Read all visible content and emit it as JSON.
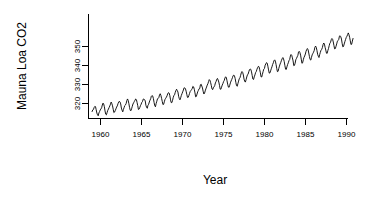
{
  "figure": {
    "background_color": "#ffffff",
    "foreground_color": "#000000",
    "width": 368,
    "height": 202
  },
  "axes": {
    "x_title": "Year",
    "y_title": "Mauna Loa CO2",
    "x_tick_labels": [
      "1960",
      "1965",
      "1970",
      "1975",
      "1980",
      "1985",
      "1990"
    ],
    "y_tick_labels": [
      "320",
      "330",
      "340",
      "350"
    ],
    "box_style": "L-shaped axes with outward ticks"
  },
  "chart_data": {
    "type": "line",
    "title": "",
    "subtitle": "",
    "xlabel": "Year",
    "ylabel": "Mauna Loa CO2",
    "xlim": [
      1958.5,
      1990.3
    ],
    "ylim": [
      312.0,
      367.0
    ],
    "xticks": [
      1960,
      1965,
      1970,
      1975,
      1980,
      1985,
      1990
    ],
    "yticks": [
      320,
      330,
      340,
      350
    ],
    "grid": false,
    "legend": null,
    "legend_position": "none",
    "annotations": [],
    "series": [
      {
        "name": "Atmospheric CO2 concentration (ppm)",
        "units": "ppm",
        "description": "Monthly mean atmospheric CO2 concentration at Mauna Loa Observatory, Jan 1959 - Dec 1990, showing long-term rising trend with annual seasonal cycle.",
        "x": [
          1959.0,
          1959.083,
          1959.167,
          1959.25,
          1959.333,
          1959.417,
          1959.5,
          1959.583,
          1959.667,
          1959.75,
          1959.833,
          1959.917,
          1960.0,
          1960.083,
          1960.167,
          1960.25,
          1960.333,
          1960.417,
          1960.5,
          1960.583,
          1960.667,
          1960.75,
          1960.833,
          1960.917,
          1961.0,
          1961.083,
          1961.167,
          1961.25,
          1961.333,
          1961.417,
          1961.5,
          1961.583,
          1961.667,
          1961.75,
          1961.833,
          1961.917,
          1962.0,
          1962.083,
          1962.167,
          1962.25,
          1962.333,
          1962.417,
          1962.5,
          1962.583,
          1962.667,
          1962.75,
          1962.833,
          1962.917,
          1963.0,
          1963.083,
          1963.167,
          1963.25,
          1963.333,
          1963.417,
          1963.5,
          1963.583,
          1963.667,
          1963.75,
          1963.833,
          1963.917,
          1964.0,
          1964.083,
          1964.167,
          1964.25,
          1964.333,
          1964.417,
          1964.5,
          1964.583,
          1964.667,
          1964.75,
          1964.833,
          1964.917,
          1965.0,
          1965.083,
          1965.167,
          1965.25,
          1965.333,
          1965.417,
          1965.5,
          1965.583,
          1965.667,
          1965.75,
          1965.833,
          1965.917,
          1966.0,
          1966.083,
          1966.167,
          1966.25,
          1966.333,
          1966.417,
          1966.5,
          1966.583,
          1966.667,
          1966.75,
          1966.833,
          1966.917,
          1967.0,
          1967.083,
          1967.167,
          1967.25,
          1967.333,
          1967.417,
          1967.5,
          1967.583,
          1967.667,
          1967.75,
          1967.833,
          1967.917,
          1968.0,
          1968.083,
          1968.167,
          1968.25,
          1968.333,
          1968.417,
          1968.5,
          1968.583,
          1968.667,
          1968.75,
          1968.833,
          1968.917,
          1969.0,
          1969.083,
          1969.167,
          1969.25,
          1969.333,
          1969.417,
          1969.5,
          1969.583,
          1969.667,
          1969.75,
          1969.833,
          1969.917,
          1970.0,
          1970.083,
          1970.167,
          1970.25,
          1970.333,
          1970.417,
          1970.5,
          1970.583,
          1970.667,
          1970.75,
          1970.833,
          1970.917,
          1971.0,
          1971.083,
          1971.167,
          1971.25,
          1971.333,
          1971.417,
          1971.5,
          1971.583,
          1971.667,
          1971.75,
          1971.833,
          1971.917,
          1972.0,
          1972.083,
          1972.167,
          1972.25,
          1972.333,
          1972.417,
          1972.5,
          1972.583,
          1972.667,
          1972.75,
          1972.833,
          1972.917,
          1973.0,
          1973.083,
          1973.167,
          1973.25,
          1973.333,
          1973.417,
          1973.5,
          1973.583,
          1973.667,
          1973.75,
          1973.833,
          1973.917,
          1974.0,
          1974.083,
          1974.167,
          1974.25,
          1974.333,
          1974.417,
          1974.5,
          1974.583,
          1974.667,
          1974.75,
          1974.833,
          1974.917,
          1975.0,
          1975.083,
          1975.167,
          1975.25,
          1975.333,
          1975.417,
          1975.5,
          1975.583,
          1975.667,
          1975.75,
          1975.833,
          1975.917,
          1976.0,
          1976.083,
          1976.167,
          1976.25,
          1976.333,
          1976.417,
          1976.5,
          1976.583,
          1976.667,
          1976.75,
          1976.833,
          1976.917,
          1977.0,
          1977.083,
          1977.167,
          1977.25,
          1977.333,
          1977.417,
          1977.5,
          1977.583,
          1977.667,
          1977.75,
          1977.833,
          1977.917,
          1978.0,
          1978.083,
          1978.167,
          1978.25,
          1978.333,
          1978.417,
          1978.5,
          1978.583,
          1978.667,
          1978.75,
          1978.833,
          1978.917,
          1979.0,
          1979.083,
          1979.167,
          1979.25,
          1979.333,
          1979.417,
          1979.5,
          1979.583,
          1979.667,
          1979.75,
          1979.833,
          1979.917,
          1980.0,
          1980.083,
          1980.167,
          1980.25,
          1980.333,
          1980.417,
          1980.5,
          1980.583,
          1980.667,
          1980.75,
          1980.833,
          1980.917,
          1981.0,
          1981.083,
          1981.167,
          1981.25,
          1981.333,
          1981.417,
          1981.5,
          1981.583,
          1981.667,
          1981.75,
          1981.833,
          1981.917,
          1982.0,
          1982.083,
          1982.167,
          1982.25,
          1982.333,
          1982.417,
          1982.5,
          1982.583,
          1982.667,
          1982.75,
          1982.833,
          1982.917,
          1983.0,
          1983.083,
          1983.167,
          1983.25,
          1983.333,
          1983.417,
          1983.5,
          1983.583,
          1983.667,
          1983.75,
          1983.833,
          1983.917,
          1984.0,
          1984.083,
          1984.167,
          1984.25,
          1984.333,
          1984.417,
          1984.5,
          1984.583,
          1984.667,
          1984.75,
          1984.833,
          1984.917,
          1985.0,
          1985.083,
          1985.167,
          1985.25,
          1985.333,
          1985.417,
          1985.5,
          1985.583,
          1985.667,
          1985.75,
          1985.833,
          1985.917,
          1986.0,
          1986.083,
          1986.167,
          1986.25,
          1986.333,
          1986.417,
          1986.5,
          1986.583,
          1986.667,
          1986.75,
          1986.833,
          1986.917,
          1987.0,
          1987.083,
          1987.167,
          1987.25,
          1987.333,
          1987.417,
          1987.5,
          1987.583,
          1987.667,
          1987.75,
          1987.833,
          1987.917,
          1988.0,
          1988.083,
          1988.167,
          1988.25,
          1988.333,
          1988.417,
          1988.5,
          1988.583,
          1988.667,
          1988.75,
          1988.833,
          1988.917,
          1989.0,
          1989.083,
          1989.167,
          1989.25,
          1989.333,
          1989.417,
          1989.5,
          1989.583,
          1989.667,
          1989.75,
          1989.833,
          1989.917,
          1990.0,
          1990.083,
          1990.167,
          1990.25,
          1990.333,
          1990.417,
          1990.5,
          1990.583,
          1990.667,
          1990.75,
          1990.833,
          1990.917
        ],
        "values": [
          315.42,
          316.31,
          316.5,
          317.56,
          318.13,
          318.0,
          316.39,
          314.65,
          313.68,
          313.18,
          314.66,
          315.43,
          316.27,
          316.81,
          317.42,
          318.87,
          319.87,
          319.43,
          318.01,
          315.74,
          314.0,
          313.68,
          314.84,
          316.03,
          316.73,
          317.54,
          318.38,
          319.31,
          320.42,
          319.61,
          318.42,
          316.63,
          314.83,
          315.16,
          315.94,
          316.85,
          317.78,
          318.4,
          319.53,
          320.42,
          320.85,
          320.45,
          319.45,
          317.25,
          316.11,
          315.27,
          316.53,
          317.53,
          318.58,
          318.92,
          319.7,
          321.22,
          322.08,
          321.31,
          319.58,
          317.61,
          316.05,
          315.83,
          316.91,
          318.2,
          319.41,
          320.07,
          320.74,
          321.4,
          322.06,
          321.73,
          320.27,
          318.54,
          316.54,
          316.71,
          317.53,
          318.55,
          319.27,
          320.28,
          320.73,
          321.97,
          322.0,
          321.71,
          321.05,
          318.71,
          317.66,
          317.14,
          318.7,
          319.25,
          320.46,
          321.43,
          322.23,
          323.54,
          323.91,
          323.59,
          322.24,
          320.2,
          318.48,
          317.94,
          319.63,
          320.87,
          322.17,
          322.34,
          322.88,
          324.25,
          324.83,
          323.93,
          322.38,
          320.76,
          319.1,
          319.24,
          320.56,
          321.8,
          322.4,
          322.99,
          323.73,
          324.86,
          325.4,
          325.2,
          323.98,
          321.95,
          320.18,
          320.09,
          321.16,
          322.74,
          323.83,
          324.26,
          325.47,
          326.5,
          327.21,
          326.54,
          325.72,
          323.5,
          322.22,
          321.62,
          322.69,
          323.95,
          324.89,
          325.82,
          326.77,
          327.97,
          327.91,
          327.5,
          326.18,
          324.53,
          322.93,
          322.9,
          323.85,
          324.96,
          326.01,
          326.51,
          327.01,
          327.62,
          328.76,
          328.4,
          327.2,
          325.27,
          323.2,
          323.4,
          324.63,
          325.85,
          326.6,
          327.47,
          327.58,
          329.56,
          329.9,
          328.92,
          327.88,
          326.16,
          324.68,
          325.04,
          326.34,
          327.39,
          328.37,
          329.4,
          330.14,
          331.33,
          332.31,
          331.9,
          330.7,
          329.15,
          327.35,
          327.02,
          327.99,
          328.48,
          329.18,
          330.55,
          331.32,
          332.48,
          332.92,
          332.08,
          331.01,
          329.23,
          327.27,
          327.21,
          328.29,
          329.41,
          330.23,
          331.25,
          331.87,
          333.14,
          333.8,
          333.43,
          331.73,
          329.9,
          328.4,
          328.17,
          329.32,
          330.59,
          331.58,
          332.39,
          333.33,
          334.41,
          334.71,
          334.17,
          332.89,
          330.77,
          329.14,
          328.78,
          330.14,
          331.52,
          332.75,
          333.24,
          334.53,
          335.9,
          336.57,
          336.1,
          334.76,
          332.59,
          331.42,
          330.98,
          332.24,
          333.68,
          334.8,
          335.22,
          336.47,
          337.59,
          337.84,
          337.72,
          336.37,
          334.51,
          332.6,
          332.38,
          333.75,
          334.78,
          336.05,
          336.59,
          337.79,
          338.71,
          339.3,
          339.12,
          337.56,
          335.92,
          333.75,
          333.7,
          335.12,
          336.56,
          337.84,
          338.19,
          339.91,
          340.6,
          341.29,
          341.0,
          339.39,
          337.43,
          335.72,
          335.84,
          336.93,
          338.04,
          339.06,
          340.3,
          341.21,
          342.33,
          342.74,
          342.08,
          340.32,
          338.26,
          336.52,
          336.68,
          338.19,
          339.44,
          340.57,
          341.44,
          342.53,
          343.39,
          343.96,
          343.18,
          341.88,
          339.65,
          337.81,
          337.69,
          339.09,
          340.32,
          341.2,
          342.35,
          342.93,
          344.77,
          345.58,
          345.14,
          343.81,
          342.21,
          339.69,
          339.82,
          340.98,
          342.82,
          343.52,
          344.33,
          345.11,
          346.88,
          347.25,
          346.62,
          345.22,
          343.11,
          340.9,
          341.18,
          342.8,
          344.04,
          344.79,
          345.82,
          347.25,
          348.17,
          348.74,
          348.07,
          346.38,
          344.51,
          342.92,
          342.62,
          344.06,
          345.38,
          346.11,
          346.78,
          347.68,
          349.37,
          350.03,
          349.37,
          347.76,
          345.73,
          344.68,
          343.99,
          345.48,
          346.72,
          347.84,
          348.29,
          349.23,
          350.8,
          351.66,
          351.07,
          349.33,
          347.92,
          346.27,
          346.18,
          347.64,
          348.78,
          350.25,
          351.54,
          352.05,
          353.41,
          354.04,
          353.62,
          352.22,
          350.27,
          348.55,
          348.72,
          349.91,
          351.18,
          352.6,
          352.92,
          353.53,
          355.26,
          355.52,
          354.97,
          353.75,
          351.52,
          349.64,
          349.83,
          351.14,
          352.37,
          353.5,
          354.55,
          355.23,
          356.04,
          357.0,
          356.07,
          354.67,
          352.76,
          350.82,
          351.04,
          352.69,
          354.07
        ]
      }
    ]
  }
}
